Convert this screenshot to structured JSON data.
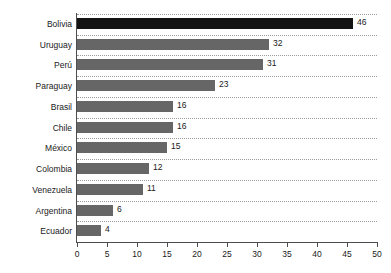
{
  "chart_data": {
    "type": "bar",
    "orientation": "horizontal",
    "title": "",
    "subtitle": "",
    "xlabel": "",
    "ylabel": "",
    "categories": [
      "Bolivia",
      "Uruguay",
      "Perú",
      "Paraguay",
      "Brasil",
      "Chile",
      "México",
      "Colombia",
      "Venezuela",
      "Argentina",
      "Ecuador"
    ],
    "values": [
      46,
      32,
      31,
      23,
      16,
      16,
      15,
      12,
      11,
      6,
      4
    ],
    "value_labels": [
      "46",
      "32",
      "31",
      "23",
      "16",
      "16",
      "15",
      "12",
      "11",
      "6",
      "4"
    ],
    "xlim": [
      0,
      50
    ],
    "x_ticks": [
      0,
      5,
      10,
      15,
      20,
      25,
      30,
      35,
      40,
      45,
      50
    ],
    "x_tick_labels": [
      "0",
      "5",
      "10",
      "15",
      "20",
      "25",
      "30",
      "35",
      "40",
      "45",
      "50"
    ],
    "grid": true,
    "grid_axis": "y",
    "grid_style": "dotted",
    "legend": null,
    "highlight_index": 0,
    "colors": {
      "bar": "#666666",
      "bar_highlight": "#141414",
      "grid": "#9b9b9b",
      "axis": "#4d4d4d",
      "text": "#1a1a1a",
      "background": "#ffffff"
    }
  }
}
